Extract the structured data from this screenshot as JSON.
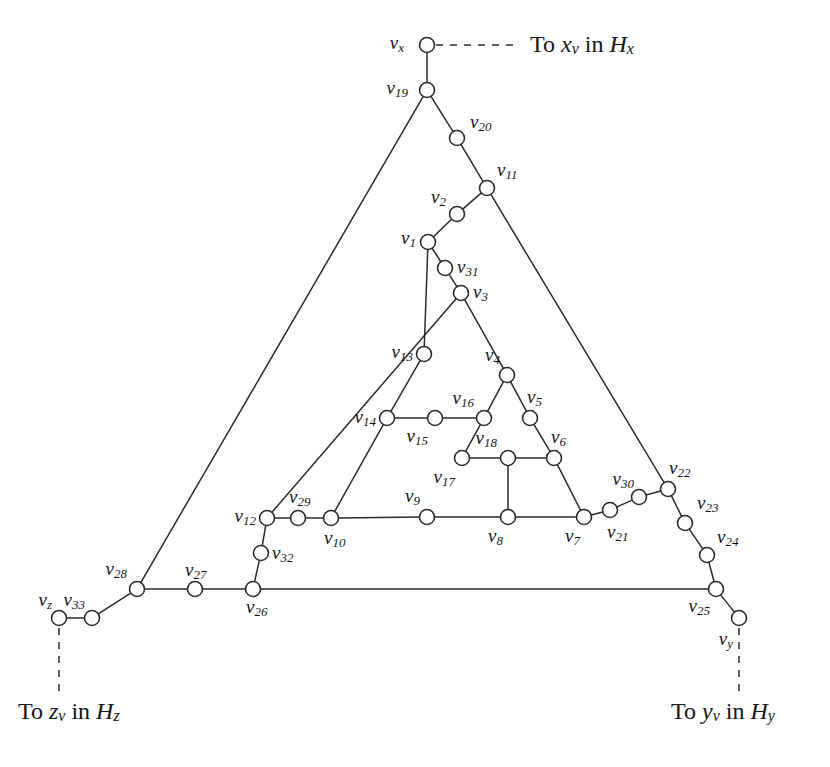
{
  "figure": {
    "background_color": "#ffffff",
    "line_color": "#2b2b2b",
    "text_color": "#171717",
    "width": 830,
    "height": 767
  },
  "captions": [
    {
      "id": "caption-x",
      "prefix": "To ",
      "var": "x",
      "varsub": "v",
      "mid": " in ",
      "tail": "H",
      "tailsub": "x",
      "x": 530,
      "y": 46,
      "anchor": "start"
    },
    {
      "id": "caption-z",
      "prefix": "To ",
      "var": "z",
      "varsub": "v",
      "mid": " in ",
      "tail": "H",
      "tailsub": "z",
      "x": 18,
      "y": 713,
      "anchor": "start"
    },
    {
      "id": "caption-y",
      "prefix": "To ",
      "var": "y",
      "varsub": "v",
      "mid": " in ",
      "tail": "H",
      "tailsub": "y",
      "x": 671,
      "y": 713,
      "anchor": "start"
    }
  ],
  "nodes": [
    {
      "id": "vx",
      "label": "v",
      "sub": "x",
      "x": 427,
      "y": 45,
      "lx": 404,
      "ly": 45,
      "anchor": "end"
    },
    {
      "id": "v19",
      "label": "v",
      "sub": "19",
      "x": 427,
      "y": 90,
      "lx": 408,
      "ly": 90,
      "anchor": "end"
    },
    {
      "id": "v20",
      "label": "v",
      "sub": "20",
      "x": 457,
      "y": 138,
      "lx": 470,
      "ly": 124,
      "anchor": "start"
    },
    {
      "id": "v11",
      "label": "v",
      "sub": "11",
      "x": 487,
      "y": 188,
      "lx": 497,
      "ly": 172,
      "anchor": "start"
    },
    {
      "id": "v2",
      "label": "v",
      "sub": "2",
      "x": 457,
      "y": 214,
      "lx": 446,
      "ly": 199,
      "anchor": "end"
    },
    {
      "id": "v1",
      "label": "v",
      "sub": "1",
      "x": 428,
      "y": 242,
      "lx": 416,
      "ly": 240,
      "anchor": "end"
    },
    {
      "id": "v31",
      "label": "v",
      "sub": "31",
      "x": 445,
      "y": 268,
      "lx": 457,
      "ly": 269,
      "anchor": "start"
    },
    {
      "id": "v3",
      "label": "v",
      "sub": "3",
      "x": 461,
      "y": 293,
      "lx": 473,
      "ly": 294,
      "anchor": "start"
    },
    {
      "id": "v13",
      "label": "v",
      "sub": "13",
      "x": 424,
      "y": 354,
      "lx": 413,
      "ly": 354,
      "anchor": "end"
    },
    {
      "id": "v4",
      "label": "v",
      "sub": "4",
      "x": 507,
      "y": 375,
      "lx": 500,
      "ly": 357,
      "anchor": "end"
    },
    {
      "id": "v5",
      "label": "v",
      "sub": "5",
      "x": 530,
      "y": 418,
      "lx": 527,
      "ly": 399,
      "anchor": "start"
    },
    {
      "id": "v16",
      "label": "v",
      "sub": "16",
      "x": 484,
      "y": 418,
      "lx": 474,
      "ly": 400,
      "anchor": "end"
    },
    {
      "id": "v14",
      "label": "v",
      "sub": "14",
      "x": 387,
      "y": 418,
      "lx": 376,
      "ly": 419,
      "anchor": "end"
    },
    {
      "id": "v15",
      "label": "v",
      "sub": "15",
      "x": 435,
      "y": 418,
      "lx": 428,
      "ly": 438,
      "anchor": "end"
    },
    {
      "id": "v6",
      "label": "v",
      "sub": "6",
      "x": 554,
      "y": 458,
      "lx": 551,
      "ly": 439,
      "anchor": "start"
    },
    {
      "id": "v18",
      "label": "v",
      "sub": "18",
      "x": 508,
      "y": 458,
      "lx": 497,
      "ly": 440,
      "anchor": "end"
    },
    {
      "id": "v17",
      "label": "v",
      "sub": "17",
      "x": 462,
      "y": 458,
      "lx": 455,
      "ly": 479,
      "anchor": "end"
    },
    {
      "id": "v9",
      "label": "v",
      "sub": "9",
      "x": 427,
      "y": 517,
      "lx": 420,
      "ly": 498,
      "anchor": "end"
    },
    {
      "id": "v8",
      "label": "v",
      "sub": "8",
      "x": 508,
      "y": 517,
      "lx": 503,
      "ly": 538,
      "anchor": "end"
    },
    {
      "id": "v7",
      "label": "v",
      "sub": "7",
      "x": 584,
      "y": 517,
      "lx": 580,
      "ly": 538,
      "anchor": "end"
    },
    {
      "id": "v21",
      "label": "v",
      "sub": "21",
      "x": 610,
      "y": 510,
      "lx": 607,
      "ly": 534,
      "anchor": "start"
    },
    {
      "id": "v30",
      "label": "v",
      "sub": "30",
      "x": 639,
      "y": 497,
      "lx": 634,
      "ly": 481,
      "anchor": "end"
    },
    {
      "id": "v22",
      "label": "v",
      "sub": "22",
      "x": 668,
      "y": 489,
      "lx": 669,
      "ly": 470,
      "anchor": "start"
    },
    {
      "id": "v23",
      "label": "v",
      "sub": "23",
      "x": 685,
      "y": 523,
      "lx": 697,
      "ly": 505,
      "anchor": "start"
    },
    {
      "id": "v24",
      "label": "v",
      "sub": "24",
      "x": 707,
      "y": 555,
      "lx": 717,
      "ly": 539,
      "anchor": "start"
    },
    {
      "id": "v25",
      "label": "v",
      "sub": "25",
      "x": 716,
      "y": 589,
      "lx": 710,
      "ly": 608,
      "anchor": "end"
    },
    {
      "id": "vy",
      "label": "v",
      "sub": "y",
      "x": 739,
      "y": 618,
      "lx": 733,
      "ly": 641,
      "anchor": "end"
    },
    {
      "id": "v12",
      "label": "v",
      "sub": "12",
      "x": 267,
      "y": 518,
      "lx": 256,
      "ly": 518,
      "anchor": "end"
    },
    {
      "id": "v29",
      "label": "v",
      "sub": "29",
      "x": 298,
      "y": 518,
      "lx": 289,
      "ly": 499,
      "anchor": "start"
    },
    {
      "id": "v10",
      "label": "v",
      "sub": "10",
      "x": 331,
      "y": 518,
      "lx": 324,
      "ly": 540,
      "anchor": "start"
    },
    {
      "id": "v32",
      "label": "v",
      "sub": "32",
      "x": 261,
      "y": 553,
      "lx": 272,
      "ly": 555,
      "anchor": "start"
    },
    {
      "id": "v26",
      "label": "v",
      "sub": "26",
      "x": 253,
      "y": 589,
      "lx": 246,
      "ly": 609,
      "anchor": "start"
    },
    {
      "id": "v27",
      "label": "v",
      "sub": "27",
      "x": 195,
      "y": 589,
      "lx": 185,
      "ly": 572,
      "anchor": "start"
    },
    {
      "id": "v28",
      "label": "v",
      "sub": "28",
      "x": 137,
      "y": 589,
      "lx": 127,
      "ly": 571,
      "anchor": "end"
    },
    {
      "id": "v33",
      "label": "v",
      "sub": "33",
      "x": 92,
      "y": 618,
      "lx": 85,
      "ly": 602,
      "anchor": "end"
    },
    {
      "id": "vz",
      "label": "v",
      "sub": "z",
      "x": 59,
      "y": 618,
      "lx": 52,
      "ly": 602,
      "anchor": "end"
    }
  ],
  "edges": [
    {
      "from": "vx",
      "to": "v19",
      "style": "solid"
    },
    {
      "from": "v19",
      "to": "v20",
      "style": "solid"
    },
    {
      "from": "v20",
      "to": "v11",
      "style": "solid"
    },
    {
      "from": "v11",
      "to": "v2",
      "style": "solid"
    },
    {
      "from": "v2",
      "to": "v1",
      "style": "solid"
    },
    {
      "from": "v1",
      "to": "v31",
      "style": "solid"
    },
    {
      "from": "v31",
      "to": "v3",
      "style": "solid"
    },
    {
      "from": "v3",
      "to": "v4",
      "style": "solid"
    },
    {
      "from": "v4",
      "to": "v5",
      "style": "solid"
    },
    {
      "from": "v5",
      "to": "v6",
      "style": "solid"
    },
    {
      "from": "v6",
      "to": "v7",
      "style": "solid"
    },
    {
      "from": "v7",
      "to": "v21",
      "style": "solid"
    },
    {
      "from": "v21",
      "to": "v30",
      "style": "solid"
    },
    {
      "from": "v30",
      "to": "v22",
      "style": "solid"
    },
    {
      "from": "v22",
      "to": "v23",
      "style": "solid"
    },
    {
      "from": "v23",
      "to": "v24",
      "style": "solid"
    },
    {
      "from": "v24",
      "to": "v25",
      "style": "solid"
    },
    {
      "from": "v25",
      "to": "vy",
      "style": "solid"
    },
    {
      "from": "v11",
      "to": "v22",
      "style": "solid"
    },
    {
      "from": "v19",
      "to": "v28",
      "style": "solid"
    },
    {
      "from": "v28",
      "to": "v27",
      "style": "solid"
    },
    {
      "from": "v27",
      "to": "v26",
      "style": "solid"
    },
    {
      "from": "v26",
      "to": "v25",
      "style": "solid"
    },
    {
      "from": "v28",
      "to": "v33",
      "style": "solid"
    },
    {
      "from": "v33",
      "to": "vz",
      "style": "solid"
    },
    {
      "from": "v1",
      "to": "v13",
      "style": "solid"
    },
    {
      "from": "v13",
      "to": "v14",
      "style": "solid"
    },
    {
      "from": "v14",
      "to": "v10",
      "style": "solid"
    },
    {
      "from": "v10",
      "to": "v29",
      "style": "solid"
    },
    {
      "from": "v29",
      "to": "v12",
      "style": "solid"
    },
    {
      "from": "v12",
      "to": "v32",
      "style": "solid"
    },
    {
      "from": "v32",
      "to": "v26",
      "style": "solid"
    },
    {
      "from": "v12",
      "to": "v3",
      "style": "solid"
    },
    {
      "from": "v10",
      "to": "v9",
      "style": "solid"
    },
    {
      "from": "v9",
      "to": "v8",
      "style": "solid"
    },
    {
      "from": "v8",
      "to": "v7",
      "style": "solid"
    },
    {
      "from": "v14",
      "to": "v15",
      "style": "solid"
    },
    {
      "from": "v15",
      "to": "v16",
      "style": "solid"
    },
    {
      "from": "v16",
      "to": "v4",
      "style": "solid"
    },
    {
      "from": "v16",
      "to": "v17",
      "style": "solid"
    },
    {
      "from": "v17",
      "to": "v18",
      "style": "solid"
    },
    {
      "from": "v18",
      "to": "v6",
      "style": "solid"
    },
    {
      "from": "v18",
      "to": "v8",
      "style": "solid"
    },
    {
      "from": "vx",
      "to": "caption-x-anchor",
      "style": "dashed",
      "x1": 436,
      "y1": 45,
      "x2": 518,
      "y2": 45
    },
    {
      "from": "vz",
      "to": "caption-z-anchor",
      "style": "dashed",
      "x1": 59,
      "y1": 628,
      "x2": 59,
      "y2": 694
    },
    {
      "from": "vy",
      "to": "caption-y-anchor",
      "style": "dashed",
      "x1": 739,
      "y1": 628,
      "x2": 739,
      "y2": 694
    }
  ],
  "node_radius": 7.5
}
